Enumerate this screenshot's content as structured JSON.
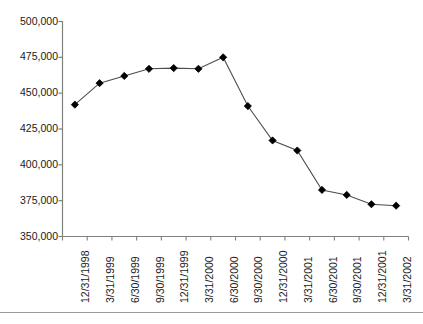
{
  "chart_data": {
    "type": "line",
    "title": "",
    "subtitle": "",
    "xlabel": "",
    "ylabel": "",
    "grid": false,
    "legend": "none",
    "marker": "diamond",
    "marker_color": "#000000",
    "line_color": "#4d4d4d",
    "axis_color": "#808080",
    "text_color": "#1a1a1a",
    "background": "#ffffff",
    "ylim": [
      350000,
      500000
    ],
    "ytick_values": [
      500000,
      475000,
      450000,
      425000,
      400000,
      375000,
      350000
    ],
    "ytick_labels": [
      "500,000",
      "475,000",
      "450,000",
      "425,000",
      "400,000",
      "375,000",
      "350,000"
    ],
    "categories": [
      "12/31/1998",
      "3/31/1999",
      "6/30/1999",
      "9/30/1999",
      "12/31/1999",
      "3/31/2000",
      "6/30/2000",
      "9/30/2000",
      "12/31/2000",
      "3/31/2001",
      "6/30/2001",
      "9/30/2001",
      "12/31/2001",
      "3/31/2002"
    ],
    "values": [
      442000,
      457000,
      462000,
      467000,
      467500,
      467000,
      475000,
      441000,
      417000,
      410000,
      382500,
      379000,
      372500,
      371500
    ]
  }
}
